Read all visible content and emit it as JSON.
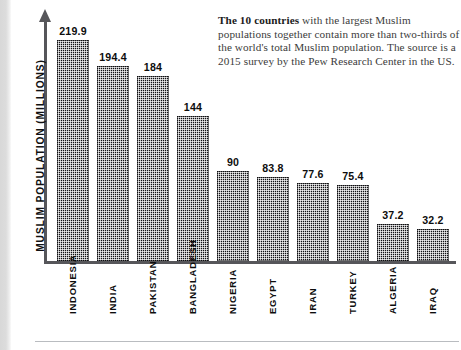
{
  "caption": {
    "lead": "The 10 countries",
    "rest": " with the largest Muslim populations together contain more than two-thirds of the world's total Muslim population. The source is a 2015 survey by the Pew Research Center in the US."
  },
  "axis": {
    "y_label": "MUSLIM POPULATION (MILLIONS)"
  },
  "chart_data": {
    "type": "bar",
    "title": "",
    "xlabel": "",
    "ylabel": "MUSLIM POPULATION (MILLIONS)",
    "ylim": [
      0,
      240
    ],
    "grid": false,
    "legend": false,
    "categories": [
      "INDONESIA",
      "INDIA",
      "PAKISTAN",
      "BANGLADESH",
      "NIGERIA",
      "EGYPT",
      "IRAN",
      "TURKEY",
      "ALGERIA",
      "IRAQ"
    ],
    "values": [
      219.9,
      194.4,
      184,
      144,
      90,
      83.8,
      77.6,
      75.4,
      37.2,
      32.2
    ],
    "value_labels": [
      "219.9",
      "194.4",
      "184",
      "144",
      "90",
      "83.8",
      "77.6",
      "75.4",
      "37.2",
      "32.2"
    ],
    "units": "millions",
    "annotation": "The 10 countries with the largest Muslim populations together contain more than two-thirds of the world's total Muslim population. The source is a 2015 survey by the Pew Research Center in the US.",
    "bar_color": "#111114",
    "axis_color": "#56565a"
  }
}
